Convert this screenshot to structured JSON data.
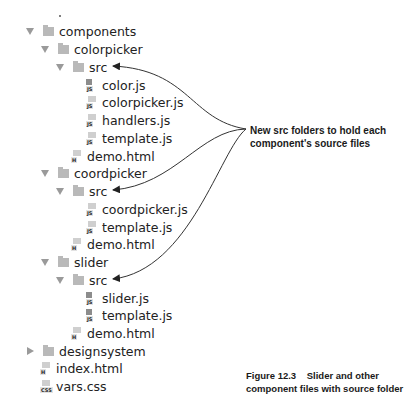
{
  "tree": [
    {
      "label": "components",
      "type": "folder",
      "expanded": true,
      "level": 0,
      "y": 22
    },
    {
      "label": "colorpicker",
      "type": "folder",
      "expanded": true,
      "level": 1,
      "y": 40
    },
    {
      "label": "src",
      "type": "folder",
      "expanded": true,
      "level": 2,
      "y": 58
    },
    {
      "label": "color.js",
      "type": "file",
      "icon": "js-file-icon",
      "level": 3,
      "y": 76
    },
    {
      "label": "colorpicker.js",
      "type": "file",
      "icon": "js-file-icon",
      "level": 3,
      "y": 93
    },
    {
      "label": "handlers.js",
      "type": "file",
      "icon": "js-file-icon",
      "level": 3,
      "y": 111
    },
    {
      "label": "template.js",
      "type": "file",
      "icon": "js-file-icon",
      "level": 3,
      "y": 129
    },
    {
      "label": "demo.html",
      "type": "file",
      "icon": "html-file-icon",
      "level": 2,
      "y": 147
    },
    {
      "label": "coordpicker",
      "type": "folder",
      "expanded": true,
      "level": 1,
      "y": 164
    },
    {
      "label": "src",
      "type": "folder",
      "expanded": true,
      "level": 2,
      "y": 182
    },
    {
      "label": "coordpicker.js",
      "type": "file",
      "icon": "js-file-icon",
      "level": 3,
      "y": 200
    },
    {
      "label": "template.js",
      "type": "file",
      "icon": "js-file-icon",
      "level": 3,
      "y": 218
    },
    {
      "label": "demo.html",
      "type": "file",
      "icon": "html-file-icon",
      "level": 2,
      "y": 235
    },
    {
      "label": "slider",
      "type": "folder",
      "expanded": true,
      "level": 1,
      "y": 253
    },
    {
      "label": "src",
      "type": "folder",
      "expanded": true,
      "level": 2,
      "y": 271
    },
    {
      "label": "slider.js",
      "type": "file",
      "icon": "js-file-icon",
      "level": 3,
      "y": 289
    },
    {
      "label": "template.js",
      "type": "file",
      "icon": "js-file-icon",
      "level": 3,
      "y": 306
    },
    {
      "label": "demo.html",
      "type": "file",
      "icon": "html-file-icon",
      "level": 2,
      "y": 324
    },
    {
      "label": "designsystem",
      "type": "folder",
      "expanded": false,
      "level": 0,
      "y": 342
    },
    {
      "label": "index.html",
      "type": "file",
      "icon": "html-file-icon",
      "level": 0,
      "y": 359
    },
    {
      "label": "vars.css",
      "type": "file",
      "icon": "css-file-icon",
      "level": 0,
      "y": 377
    }
  ],
  "file_tags": {
    "js": "JS",
    "html": "H",
    "css": "CSS"
  },
  "callout": {
    "line1": "New src folders to hold each",
    "line2": "component's source files"
  },
  "caption": {
    "line1": "Figure 12.3    Slider and other",
    "line2": "component files with source folder"
  }
}
